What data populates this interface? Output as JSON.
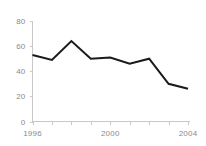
{
  "chart_data": {
    "type": "line",
    "title": "",
    "subtitle": "",
    "xlabel": "",
    "ylabel": "",
    "x": [
      1996,
      1997,
      1998,
      1999,
      2000,
      2001,
      2002,
      2003,
      2004
    ],
    "categories": [
      "1996",
      "1997",
      "1998",
      "1999",
      "2000",
      "2001",
      "2002",
      "2003",
      "2004"
    ],
    "values": [
      53,
      49,
      64,
      50,
      51,
      46,
      50,
      30,
      26
    ],
    "series": [
      {
        "name": "",
        "values": [
          53,
          49,
          64,
          50,
          51,
          46,
          50,
          30,
          26
        ],
        "color": "#1a1a1a"
      }
    ],
    "xlim": [
      1996,
      2004
    ],
    "ylim": [
      0,
      80
    ],
    "y_ticks": [
      0,
      20,
      40,
      60,
      80
    ],
    "y_tick_labels": [
      "0",
      "20",
      "40",
      "60",
      "80"
    ],
    "x_ticks": [
      1996,
      1997,
      1998,
      1999,
      2000,
      2001,
      2002,
      2003,
      2004
    ],
    "x_tick_labels": [
      "1996",
      "",
      "",
      "",
      "2000",
      "",
      "",
      "",
      "2004"
    ],
    "x_labeled_ticks": [
      "1996",
      "2000",
      "2004"
    ],
    "grid": false,
    "legend": false,
    "legend_position": "none",
    "annotations": []
  },
  "style": {
    "background": "#ffffff",
    "axis_color": "#c8c8c8",
    "tick_label_color": "#8a8a8a",
    "line_color": "#1a1a1a"
  }
}
